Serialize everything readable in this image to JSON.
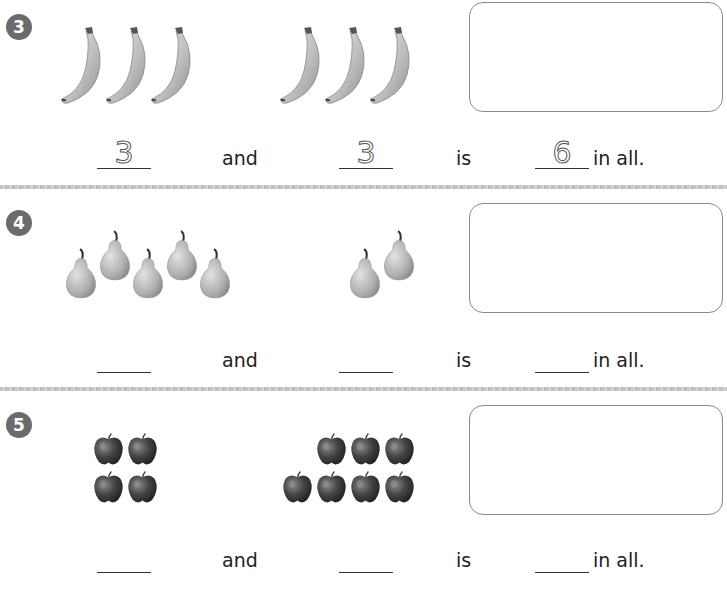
{
  "worksheet": {
    "problems": [
      {
        "number": "3",
        "group_a": {
          "fruit": "banana",
          "count": 3
        },
        "group_b": {
          "fruit": "banana",
          "count": 3
        },
        "sentence": {
          "blank_a": "3",
          "and_label": "and",
          "blank_b": "3",
          "is_label": "is",
          "blank_total": "6",
          "in_all_label": "in all."
        }
      },
      {
        "number": "4",
        "group_a": {
          "fruit": "pear",
          "count": 5
        },
        "group_b": {
          "fruit": "pear",
          "count": 2
        },
        "sentence": {
          "blank_a": "",
          "and_label": "and",
          "blank_b": "",
          "is_label": "is",
          "blank_total": "",
          "in_all_label": "in all."
        }
      },
      {
        "number": "5",
        "group_a": {
          "fruit": "apple",
          "count": 4
        },
        "group_b": {
          "fruit": "apple",
          "count": 7
        },
        "sentence": {
          "blank_a": "",
          "and_label": "and",
          "blank_b": "",
          "is_label": "is",
          "blank_total": "",
          "in_all_label": "in all."
        }
      }
    ]
  },
  "colors": {
    "badge": "#6b6b6b",
    "box_border": "#8a8a8a",
    "separator": "#c6c6c6",
    "text": "#222222"
  }
}
